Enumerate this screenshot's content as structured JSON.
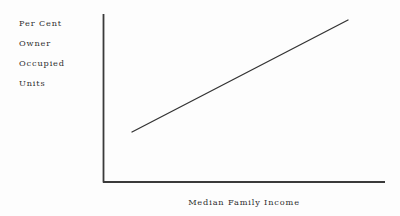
{
  "chart_data": {
    "type": "line",
    "title": "",
    "subtitle": "",
    "xlabel": "Median Family Income",
    "ylabel": "Per Cent Owner Occupied Units",
    "ylabel_lines": [
      "Per Cent",
      "Owner",
      "Occupied",
      "Units"
    ],
    "legend": [],
    "annotations": [],
    "grid": false,
    "ticks": {
      "x_tick_labels": [],
      "y_tick_labels": []
    },
    "axis_ranges": {
      "xlim": [
        0,
        1
      ],
      "ylim": [
        0,
        1
      ]
    },
    "series": [
      {
        "name": "Per Cent Owner Occupied Units vs Median Family Income",
        "style": "straight-line",
        "x": [
          0.103,
          1.0
        ],
        "y": [
          0.304,
          0.964
        ],
        "points_px": [
          {
            "x": 132,
            "y": 132
          },
          {
            "x": 348,
            "y": 20
          }
        ]
      }
    ],
    "axes_px": {
      "y_axis_x": 103,
      "y_axis_top": 14,
      "origin_x": 103,
      "origin_y": 182,
      "x_axis_right": 385
    },
    "colors": {
      "background": "#fdfdfd",
      "axis": "#3a3a3a",
      "trend_line": "#333333",
      "text": "#2e2e2e"
    }
  }
}
